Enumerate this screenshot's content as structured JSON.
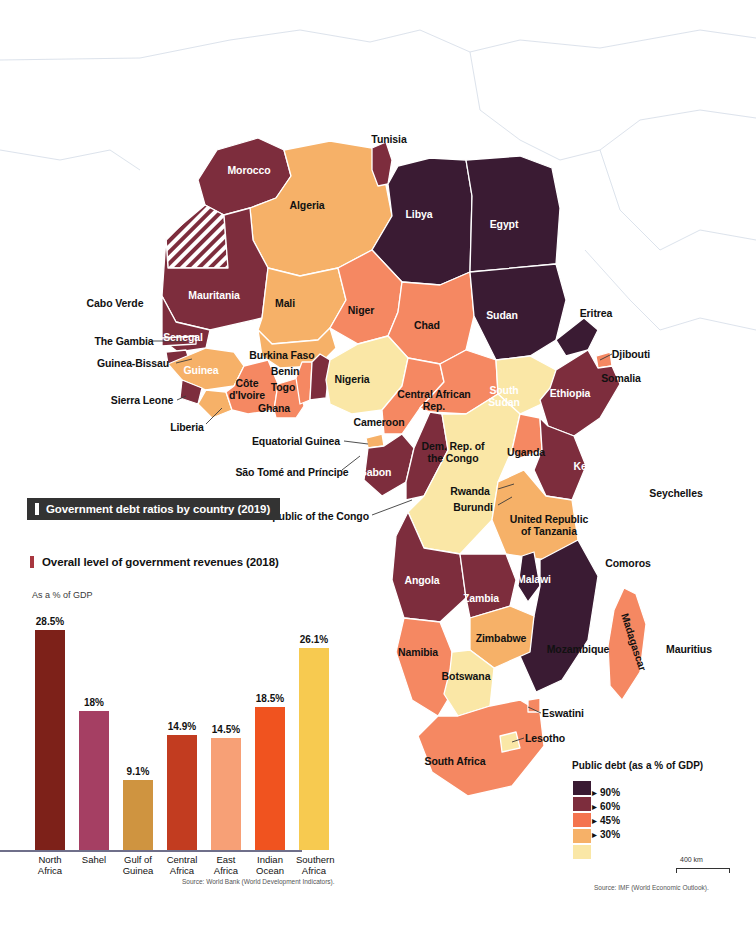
{
  "map": {
    "debt_title": "Government debt ratios by country (2019)",
    "source": "Source: IMF (World Economic Outlook).",
    "scale_label": "400 km",
    "legend": {
      "title": "Public debt (as a % of GDP)",
      "swatches": [
        "#3a1b33",
        "#7d2d3d",
        "#f4744f",
        "#f6b168",
        "#fae7a6"
      ],
      "breaks": [
        "90%",
        "60%",
        "45%",
        "30%"
      ],
      "arrow": "▸"
    },
    "countries": [
      {
        "name": "Tunisia",
        "x": 389,
        "y": 139,
        "light": false
      },
      {
        "name": "Morocco",
        "x": 249,
        "y": 170,
        "light": true
      },
      {
        "name": "Algeria",
        "x": 307,
        "y": 205,
        "light": false
      },
      {
        "name": "Libya",
        "x": 419,
        "y": 214,
        "light": true
      },
      {
        "name": "Egypt",
        "x": 504,
        "y": 224,
        "light": true
      },
      {
        "name": "Mauritania",
        "x": 214,
        "y": 295,
        "light": true
      },
      {
        "name": "Mali",
        "x": 285,
        "y": 303,
        "light": false
      },
      {
        "name": "Niger",
        "x": 361,
        "y": 310,
        "light": false
      },
      {
        "name": "Chad",
        "x": 427,
        "y": 325,
        "light": false
      },
      {
        "name": "Sudan",
        "x": 502,
        "y": 315,
        "light": true
      },
      {
        "name": "Eritrea",
        "x": 596,
        "y": 313,
        "light": false
      },
      {
        "name": "Cabo Verde",
        "x": 115,
        "y": 303,
        "light": false
      },
      {
        "name": "Senegal",
        "x": 183,
        "y": 337,
        "light": true
      },
      {
        "name": "The Gambia",
        "x": 124,
        "y": 341,
        "light": false
      },
      {
        "name": "Guinea-Bissau",
        "x": 133,
        "y": 363,
        "light": false
      },
      {
        "name": "Guinea",
        "x": 201,
        "y": 370,
        "light": true
      },
      {
        "name": "Burkina Faso",
        "x": 282,
        "y": 355,
        "light": false
      },
      {
        "name": "Benin",
        "x": 285,
        "y": 371,
        "light": false
      },
      {
        "name": "Togo",
        "x": 283,
        "y": 387,
        "light": false
      },
      {
        "name": "Nigeria",
        "x": 352,
        "y": 379,
        "light": false
      },
      {
        "name": "Côte d'Ivoire",
        "x": 247,
        "y": 389,
        "light": false,
        "two": true
      },
      {
        "name": "Ghana",
        "x": 274,
        "y": 408,
        "light": false
      },
      {
        "name": "Sierra Leone",
        "x": 142,
        "y": 400,
        "light": false
      },
      {
        "name": "Liberia",
        "x": 187,
        "y": 427,
        "light": false
      },
      {
        "name": "Cameroon",
        "x": 379,
        "y": 422,
        "light": false
      },
      {
        "name": "Central African Rep.",
        "x": 434,
        "y": 400,
        "light": false,
        "two": true
      },
      {
        "name": "South Sudan",
        "x": 504,
        "y": 396,
        "light": true,
        "two": true
      },
      {
        "name": "Ethiopia",
        "x": 570,
        "y": 393,
        "light": true
      },
      {
        "name": "Djibouti",
        "x": 631,
        "y": 354,
        "light": false
      },
      {
        "name": "Somalia",
        "x": 621,
        "y": 378,
        "light": false
      },
      {
        "name": "Equatorial Guinea",
        "x": 296,
        "y": 441,
        "light": false
      },
      {
        "name": "São Tomé and Príncipe",
        "x": 292,
        "y": 472,
        "light": false
      },
      {
        "name": "Gabon",
        "x": 375,
        "y": 472,
        "light": true
      },
      {
        "name": "Republic of the Congo",
        "x": 314,
        "y": 516,
        "light": false
      },
      {
        "name": "Dem. Rep. of the Congo",
        "x": 453,
        "y": 452,
        "light": false,
        "two": true
      },
      {
        "name": "Uganda",
        "x": 526,
        "y": 452,
        "light": false
      },
      {
        "name": "Kenya",
        "x": 589,
        "y": 466,
        "light": true
      },
      {
        "name": "Rwanda",
        "x": 470,
        "y": 491,
        "light": false
      },
      {
        "name": "Burundi",
        "x": 473,
        "y": 507,
        "light": false
      },
      {
        "name": "United Republic of Tanzania",
        "x": 549,
        "y": 525,
        "light": false,
        "two": true
      },
      {
        "name": "Seychelles",
        "x": 676,
        "y": 493,
        "light": false
      },
      {
        "name": "Angola",
        "x": 422,
        "y": 580,
        "light": true
      },
      {
        "name": "Zambia",
        "x": 481,
        "y": 598,
        "light": true
      },
      {
        "name": "Malawi",
        "x": 534,
        "y": 579,
        "light": true
      },
      {
        "name": "Comoros",
        "x": 628,
        "y": 563,
        "light": false
      },
      {
        "name": "Zimbabwe",
        "x": 501,
        "y": 638,
        "light": false
      },
      {
        "name": "Mozambique",
        "x": 578,
        "y": 649,
        "light": false
      },
      {
        "name": "Madagascar",
        "x": 634,
        "y": 642,
        "light": false,
        "rot": true
      },
      {
        "name": "Mauritius",
        "x": 689,
        "y": 649,
        "light": false
      },
      {
        "name": "Namibia",
        "x": 418,
        "y": 652,
        "light": false
      },
      {
        "name": "Botswana",
        "x": 466,
        "y": 676,
        "light": false
      },
      {
        "name": "Eswatini",
        "x": 563,
        "y": 713,
        "light": false
      },
      {
        "name": "Lesotho",
        "x": 545,
        "y": 738,
        "light": false
      },
      {
        "name": "South Africa",
        "x": 455,
        "y": 761,
        "light": false
      }
    ]
  },
  "revenues": {
    "title": "Overall level of government revenues (2018)",
    "axis_note": "As a % of GDP",
    "source": "Source: World Bank (World Development Indicators)."
  },
  "chart_data": {
    "type": "bar",
    "title": "Overall level of government revenues (2018)",
    "xlabel": "",
    "ylabel": "As a % of GDP",
    "ylim": [
      0,
      30
    ],
    "grid": false,
    "legend": "none",
    "categories": [
      "North Africa",
      "Sahel",
      "Gulf of Guinea",
      "Central Africa",
      "East Africa",
      "Indian Ocean",
      "Southern Africa"
    ],
    "category_lines": [
      [
        "North",
        "Africa"
      ],
      [
        "Sahel",
        ""
      ],
      [
        "Gulf of",
        "Guinea"
      ],
      [
        "Central",
        "Africa"
      ],
      [
        "East",
        "Africa"
      ],
      [
        "Indian",
        "Ocean"
      ],
      [
        "Southern",
        "Africa"
      ]
    ],
    "values": [
      28.5,
      18,
      9.1,
      14.9,
      14.5,
      18.5,
      26.1
    ],
    "value_labels": [
      "28.5%",
      "18%",
      "9.1%",
      "14.9%",
      "14.5%",
      "18.5%",
      "26.1%"
    ],
    "colors": [
      "#7d2119",
      "#a53f63",
      "#cf9440",
      "#c23c20",
      "#f7a076",
      "#f0531f",
      "#f7ca50"
    ]
  }
}
